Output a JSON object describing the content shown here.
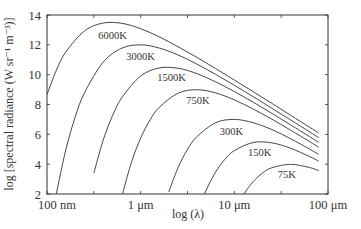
{
  "chart_data": {
    "type": "line",
    "title": "",
    "xlabel": "log (λ)",
    "ylabel": "log [spectral radiance (W sr⁻¹ m⁻³)]",
    "x_scale": "log10 wavelength (m)",
    "xlim": [
      -7,
      -4
    ],
    "ylim": [
      2,
      14
    ],
    "grid": false,
    "legend": "none (inline curve labels)",
    "x_ticks": [
      {
        "value": -7,
        "label": "100 nm"
      },
      {
        "value": -6,
        "label": "1 μm"
      },
      {
        "value": -5,
        "label": "10 μm"
      },
      {
        "value": -4,
        "label": "100 μm"
      }
    ],
    "x_minor_ticks": [
      -6.5,
      -5.5,
      -4.5
    ],
    "y_ticks": [
      2,
      4,
      6,
      8,
      10,
      12,
      14
    ],
    "series": [
      {
        "name": "6000K",
        "label_at": [
          -6.3,
          12.6
        ],
        "x": [
          -7.0,
          -6.9,
          -6.8,
          -6.6,
          -6.4,
          -6.2,
          -6.0,
          -5.8,
          -5.6,
          -5.4,
          -5.2,
          -5.0,
          -4.8,
          -4.6,
          -4.4,
          -4.2,
          -4.1
        ],
        "y": [
          8.66,
          10.3,
          11.51,
          12.93,
          13.46,
          13.44,
          13.08,
          12.53,
          11.87,
          11.16,
          10.41,
          9.64,
          8.86,
          8.08,
          7.28,
          6.49,
          6.09
        ]
      },
      {
        "name": "3000K",
        "label_at": [
          -6.0,
          11.2
        ],
        "x": [
          -6.9,
          -6.8,
          -6.7,
          -6.6,
          -6.4,
          -6.2,
          -6.0,
          -5.8,
          -5.6,
          -5.4,
          -5.2,
          -5.0,
          -4.8,
          -4.6,
          -4.4,
          -4.2,
          -4.1
        ],
        "y": [
          2.03,
          4.94,
          7.14,
          8.78,
          10.84,
          11.78,
          12.0,
          11.78,
          11.32,
          10.71,
          10.02,
          9.29,
          8.53,
          7.75,
          6.97,
          6.18,
          5.78
        ]
      },
      {
        "name": "1500K",
        "label_at": [
          -5.67,
          9.8
        ],
        "x": [
          -6.5,
          -6.4,
          -6.3,
          -6.2,
          -6.0,
          -5.8,
          -5.6,
          -5.4,
          -5.2,
          -5.0,
          -4.8,
          -4.6,
          -4.4,
          -4.2,
          -4.1
        ],
        "y": [
          3.4,
          5.61,
          7.26,
          8.47,
          9.91,
          10.45,
          10.43,
          10.07,
          9.52,
          8.87,
          8.16,
          7.41,
          6.64,
          5.86,
          5.47
        ]
      },
      {
        "name": "750K",
        "label_at": [
          -5.39,
          8.3
        ],
        "x": [
          -6.2,
          -6.1,
          -6.0,
          -5.9,
          -5.8,
          -5.6,
          -5.4,
          -5.2,
          -5.0,
          -4.8,
          -4.6,
          -4.4,
          -4.2,
          -4.1
        ],
        "y": [
          1.87,
          4.09,
          5.75,
          6.96,
          7.82,
          8.76,
          8.99,
          8.78,
          8.31,
          7.7,
          7.02,
          6.28,
          5.53,
          5.14
        ]
      },
      {
        "name": "300K",
        "label_at": [
          -5.03,
          6.2
        ],
        "x": [
          -5.7,
          -5.6,
          -5.5,
          -5.4,
          -5.2,
          -5.0,
          -4.8,
          -4.6,
          -4.4,
          -4.2,
          -4.1
        ],
        "y": [
          2.14,
          3.78,
          4.99,
          5.84,
          6.78,
          7.0,
          6.78,
          6.32,
          5.71,
          5.02,
          4.66
        ]
      },
      {
        "name": "150K",
        "label_at": [
          -4.73,
          4.8
        ],
        "x": [
          -5.4,
          -5.3,
          -5.2,
          -5.1,
          -5.0,
          -4.8,
          -4.6,
          -4.4,
          -4.2,
          -4.1
        ],
        "y": [
          0.61,
          2.26,
          3.47,
          4.33,
          4.91,
          5.45,
          5.43,
          5.07,
          4.52,
          4.21
        ]
      },
      {
        "name": "75K",
        "label_at": [
          -4.44,
          3.3
        ],
        "x": [
          -5.0,
          -4.9,
          -4.8,
          -4.7,
          -4.6,
          -4.4,
          -4.2,
          -4.1
        ],
        "y": [
          0.75,
          1.96,
          2.82,
          3.4,
          3.76,
          3.99,
          3.78,
          3.57
        ]
      }
    ]
  }
}
